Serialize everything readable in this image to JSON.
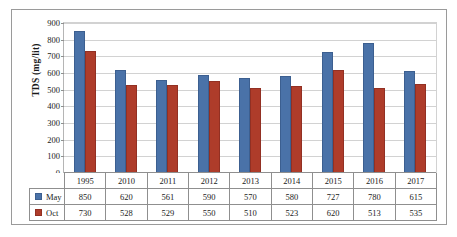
{
  "chart_data": {
    "type": "bar",
    "title": "",
    "xlabel": "",
    "ylabel": "TDS (mg/lit)",
    "categories": [
      "1995",
      "2010",
      "2011",
      "2012",
      "2013",
      "2014",
      "2015",
      "2016",
      "2017"
    ],
    "series": [
      {
        "name": "May",
        "color": "#4a72a8",
        "values": [
          850,
          620,
          561,
          590,
          570,
          580,
          727,
          780,
          615
        ]
      },
      {
        "name": "Oct",
        "color": "#ae3c2a",
        "values": [
          730,
          528,
          529,
          550,
          510,
          523,
          620,
          513,
          535
        ]
      }
    ],
    "ylim": [
      0,
      900
    ],
    "yticks": [
      "0",
      "100",
      "200",
      "300",
      "400",
      "500",
      "600",
      "700",
      "800",
      "900"
    ],
    "ytick_values": [
      0,
      100,
      200,
      300,
      400,
      500,
      600,
      700,
      800,
      900
    ],
    "grid": true,
    "legend_position": "bottom-table",
    "data_table_visible": true
  }
}
